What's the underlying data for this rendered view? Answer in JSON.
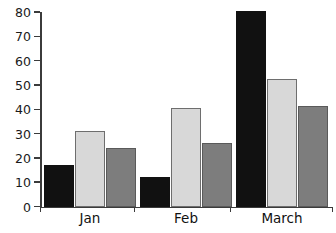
{
  "chart": {
    "title_partial": "",
    "y_axis": {
      "ticks": [
        "0",
        "10",
        "20",
        "30",
        "40",
        "50",
        "60",
        "70",
        "80"
      ]
    },
    "x_axis": {
      "groups": [
        "Jan",
        "Feb",
        "March"
      ]
    },
    "series_colors": [
      "#111111",
      "#d8d8d8",
      "#7d7d7d"
    ]
  },
  "chart_data": {
    "type": "bar",
    "title": "",
    "xlabel": "",
    "ylabel": "",
    "ylim": [
      0,
      80
    ],
    "yticks": [
      0,
      10,
      20,
      30,
      40,
      50,
      60,
      70,
      80
    ],
    "grid": false,
    "legend": false,
    "categories": [
      "Jan",
      "Feb",
      "March"
    ],
    "series": [
      {
        "name": "Series 1",
        "color": "#111111",
        "values": [
          17,
          12,
          80.5
        ]
      },
      {
        "name": "Series 2",
        "color": "#d8d8d8",
        "values": [
          31,
          40.5,
          52.5
        ]
      },
      {
        "name": "Series 3",
        "color": "#7d7d7d",
        "values": [
          24,
          26,
          41.5
        ]
      }
    ]
  }
}
